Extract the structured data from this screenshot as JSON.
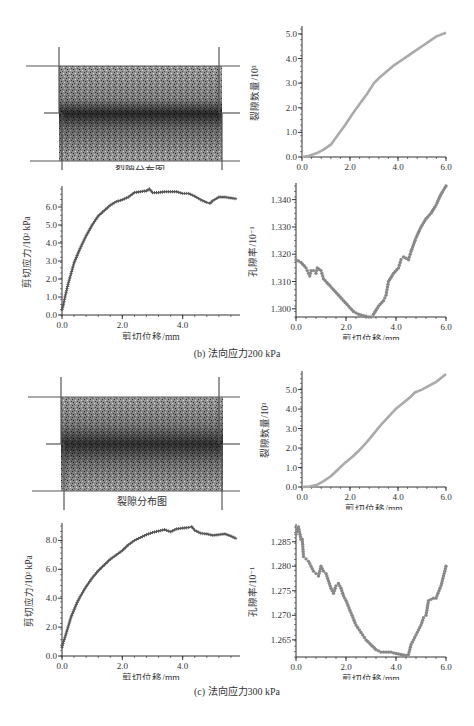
{
  "figure": {
    "subfigures": [
      {
        "label": "(b) 法向应力200 kPa",
        "crack_map_label": "裂隙分布图",
        "crack_map_grid_color": "#555555",
        "band_intensity": "dark central band"
      },
      {
        "label": "(c) 法向应力300 kPa",
        "crack_map_label": "裂隙分布图",
        "crack_map_grid_color": "#555555",
        "band_intensity": "dark central band"
      }
    ]
  },
  "chart_data": [
    {
      "id": "b-crack-count",
      "type": "line",
      "title": "",
      "xlabel": "剪切位移/mm",
      "ylabel": "裂隙数量/10³",
      "xlim": [
        0,
        6
      ],
      "ylim": [
        0,
        5.2
      ],
      "xticks": [
        "0.0",
        "2.0",
        "4.0",
        "6.0"
      ],
      "yticks": [
        "0.0",
        "1.0",
        "2.0",
        "3.0",
        "4.0",
        "5.0"
      ],
      "color": "#aaaaaa",
      "x": [
        0,
        0.3,
        0.6,
        0.9,
        1.2,
        1.5,
        1.8,
        2.1,
        2.4,
        2.7,
        3.0,
        3.2,
        3.5,
        3.8,
        4.1,
        4.4,
        4.7,
        5.0,
        5.3,
        5.6,
        6.0
      ],
      "y": [
        0,
        0.05,
        0.15,
        0.3,
        0.5,
        0.9,
        1.3,
        1.75,
        2.15,
        2.55,
        3.0,
        3.2,
        3.45,
        3.7,
        3.9,
        4.1,
        4.3,
        4.5,
        4.7,
        4.9,
        5.05
      ]
    },
    {
      "id": "b-shear-stress",
      "type": "line",
      "title": "",
      "xlabel": "剪切位移/mm",
      "ylabel": "剪切应力/10² kPa",
      "xlim": [
        0,
        5.9
      ],
      "ylim": [
        0,
        7.0
      ],
      "xticks": [
        "0.0",
        "2.0",
        "4.0"
      ],
      "yticks": [
        "0.0",
        "1.0",
        "2.0",
        "3.0",
        "4.0",
        "5.0",
        "6.0"
      ],
      "color": "#555555",
      "marker": "+",
      "x": [
        0,
        0.05,
        0.1,
        0.2,
        0.3,
        0.4,
        0.5,
        0.6,
        0.8,
        1.0,
        1.2,
        1.4,
        1.6,
        1.8,
        2.0,
        2.2,
        2.4,
        2.6,
        2.8,
        2.9,
        3.0,
        3.2,
        3.4,
        3.6,
        3.8,
        4.0,
        4.2,
        4.4,
        4.6,
        4.8,
        4.9,
        5.0,
        5.2,
        5.4,
        5.6,
        5.8
      ],
      "y": [
        0.3,
        0.6,
        1.0,
        1.7,
        2.3,
        2.9,
        3.3,
        3.7,
        4.4,
        5.0,
        5.5,
        5.8,
        6.1,
        6.3,
        6.4,
        6.55,
        6.8,
        6.85,
        6.9,
        7.0,
        6.8,
        6.8,
        6.85,
        6.85,
        6.85,
        6.75,
        6.75,
        6.6,
        6.4,
        6.25,
        6.2,
        6.35,
        6.55,
        6.55,
        6.5,
        6.45
      ]
    },
    {
      "id": "b-porosity",
      "type": "scatter",
      "title": "",
      "xlabel": "剪切位移/mm",
      "ylabel": "孔隙率/10⁻¹",
      "xlim": [
        0,
        6
      ],
      "ylim": [
        1.297,
        1.345
      ],
      "xticks": [
        "0.0",
        "2.0",
        "4.0",
        "6.0"
      ],
      "yticks": [
        "1.300",
        "1.310",
        "1.320",
        "1.330",
        "1.340"
      ],
      "color": "#888888",
      "x": [
        0,
        0.2,
        0.4,
        0.5,
        0.55,
        0.6,
        0.7,
        0.8,
        0.85,
        1.0,
        1.1,
        1.3,
        1.5,
        1.7,
        1.9,
        2.1,
        2.3,
        2.5,
        2.7,
        2.9,
        3.0,
        3.1,
        3.3,
        3.5,
        3.6,
        3.7,
        3.9,
        4.1,
        4.2,
        4.3,
        4.5,
        4.6,
        4.8,
        5.0,
        5.2,
        5.4,
        5.6,
        5.8,
        6.0
      ],
      "y": [
        1.318,
        1.317,
        1.315,
        1.313,
        1.312,
        1.314,
        1.314,
        1.313,
        1.315,
        1.314,
        1.311,
        1.309,
        1.307,
        1.305,
        1.303,
        1.301,
        1.299,
        1.298,
        1.2975,
        1.297,
        1.297,
        1.298,
        1.301,
        1.303,
        1.305,
        1.31,
        1.313,
        1.315,
        1.318,
        1.319,
        1.318,
        1.321,
        1.326,
        1.33,
        1.333,
        1.335,
        1.338,
        1.342,
        1.345
      ]
    },
    {
      "id": "c-crack-count",
      "type": "line",
      "title": "",
      "xlabel": "剪切位移/mm",
      "ylabel": "裂隙数量/10³",
      "xlim": [
        0,
        6
      ],
      "ylim": [
        0,
        5.8
      ],
      "xticks": [
        "0.0",
        "2.0",
        "4.0",
        "6.0"
      ],
      "yticks": [
        "0.0",
        "1.0",
        "2.0",
        "3.0",
        "4.0",
        "5.0"
      ],
      "color": "#aaaaaa",
      "x": [
        0,
        0.3,
        0.6,
        0.9,
        1.2,
        1.5,
        1.8,
        2.1,
        2.4,
        2.7,
        3.0,
        3.3,
        3.6,
        3.9,
        4.2,
        4.5,
        4.7,
        5.0,
        5.3,
        5.6,
        6.0
      ],
      "y": [
        0,
        0.02,
        0.1,
        0.3,
        0.55,
        0.9,
        1.25,
        1.55,
        1.9,
        2.3,
        2.75,
        3.2,
        3.6,
        4.0,
        4.3,
        4.6,
        4.85,
        5.0,
        5.2,
        5.4,
        5.8
      ]
    },
    {
      "id": "c-shear-stress",
      "type": "line",
      "title": "",
      "xlabel": "剪切位移/mm",
      "ylabel": "剪切应力/10² kPa",
      "xlim": [
        0,
        5.9
      ],
      "ylim": [
        0,
        9.0
      ],
      "xticks": [
        "0.0",
        "2.0",
        "4.0"
      ],
      "yticks": [
        "0.0",
        "2.0",
        "4.0",
        "6.0",
        "8.0"
      ],
      "color": "#555555",
      "marker": "+",
      "x": [
        0,
        0.05,
        0.1,
        0.2,
        0.3,
        0.4,
        0.5,
        0.6,
        0.8,
        1.0,
        1.2,
        1.4,
        1.6,
        1.8,
        2.0,
        2.2,
        2.4,
        2.6,
        2.8,
        3.0,
        3.2,
        3.4,
        3.6,
        3.8,
        4.0,
        4.2,
        4.3,
        4.4,
        4.6,
        4.8,
        5.0,
        5.2,
        5.4,
        5.6,
        5.8
      ],
      "y": [
        0.6,
        1.0,
        1.3,
        2.0,
        2.7,
        3.2,
        3.7,
        4.1,
        4.8,
        5.4,
        5.9,
        6.3,
        6.7,
        7.0,
        7.3,
        7.7,
        8.0,
        8.2,
        8.4,
        8.55,
        8.65,
        8.75,
        8.6,
        8.8,
        8.85,
        8.9,
        8.95,
        8.7,
        8.5,
        8.45,
        8.35,
        8.4,
        8.45,
        8.3,
        8.1
      ]
    },
    {
      "id": "c-porosity",
      "type": "scatter",
      "title": "",
      "xlabel": "剪切位移/mm",
      "ylabel": "孔隙率/10⁻¹",
      "xlim": [
        0,
        6
      ],
      "ylim": [
        1.2615,
        1.288
      ],
      "xticks": [
        "0.0",
        "2.0",
        "4.0",
        "6.0"
      ],
      "yticks": [
        "1.265",
        "1.270",
        "1.275",
        "1.280",
        "1.285"
      ],
      "color": "#888888",
      "x": [
        0,
        0.05,
        0.1,
        0.2,
        0.25,
        0.3,
        0.4,
        0.5,
        0.6,
        0.7,
        0.8,
        0.9,
        1.0,
        1.1,
        1.2,
        1.3,
        1.4,
        1.5,
        1.6,
        1.7,
        1.8,
        1.9,
        2.0,
        2.2,
        2.4,
        2.6,
        2.8,
        3.0,
        3.2,
        3.4,
        3.6,
        3.8,
        4.0,
        4.2,
        4.4,
        4.5,
        4.6,
        4.8,
        5.0,
        5.1,
        5.2,
        5.3,
        5.5,
        5.6,
        5.8,
        6.0
      ],
      "y": [
        1.2865,
        1.2875,
        1.288,
        1.2855,
        1.2855,
        1.282,
        1.2815,
        1.281,
        1.28,
        1.279,
        1.2785,
        1.278,
        1.28,
        1.279,
        1.2785,
        1.277,
        1.2755,
        1.2745,
        1.276,
        1.2765,
        1.2755,
        1.274,
        1.273,
        1.2705,
        1.268,
        1.2665,
        1.265,
        1.264,
        1.263,
        1.2625,
        1.2625,
        1.2625,
        1.2622,
        1.262,
        1.2618,
        1.262,
        1.264,
        1.266,
        1.268,
        1.2695,
        1.27,
        1.273,
        1.2735,
        1.2735,
        1.276,
        1.28
      ]
    }
  ]
}
